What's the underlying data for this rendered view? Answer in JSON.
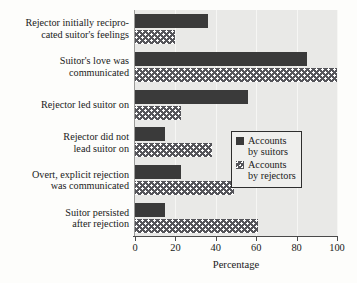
{
  "chart_data": {
    "type": "bar",
    "orientation": "horizontal",
    "title": "",
    "xlabel": "Percentage",
    "ylabel": "",
    "xlim": [
      0,
      100
    ],
    "xticks": [
      0,
      20,
      40,
      60,
      80,
      100
    ],
    "grid": true,
    "legend_position": "middle-right",
    "categories": [
      "Rejector initially recipro-\ncated suitor's feelings",
      "Suitor's love was\ncommunicated",
      "Rejector led suitor on",
      "Rejector did not\nlead suitor on",
      "Overt, explicit rejection\nwas communicated",
      "Suitor persisted\nafter rejection"
    ],
    "series": [
      {
        "name": "Accounts\nby suitors",
        "legend_label": "Accounts by suitors",
        "fill": "solid-dark",
        "color": "#3a3a3a",
        "values": [
          36,
          85,
          56,
          15,
          23,
          15
        ]
      },
      {
        "name": "Accounts\nby rejectors",
        "legend_label": "Accounts by rejectors",
        "fill": "dotted",
        "color": "#55555a",
        "values": [
          20,
          100,
          23,
          38,
          49,
          61
        ]
      }
    ]
  },
  "legend": {
    "entries": [
      "Accounts\nby suitors",
      "Accounts\nby rejectors"
    ]
  },
  "axis": {
    "x_title": "Percentage",
    "tick_labels": [
      "0",
      "20",
      "40",
      "60",
      "80",
      "100"
    ]
  }
}
